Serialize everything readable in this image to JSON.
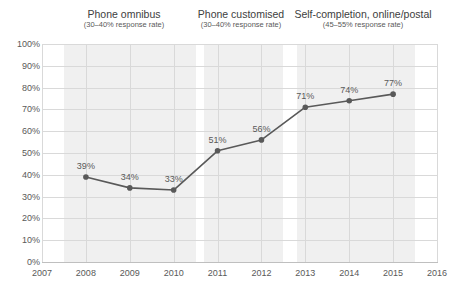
{
  "chart_data": {
    "type": "line",
    "title": "",
    "subtitle": "",
    "xlabel": "",
    "ylabel": "",
    "xlim": [
      2007,
      2016
    ],
    "ylim": [
      0,
      100
    ],
    "grid": true,
    "legend_position": "none",
    "x": [
      2008,
      2009,
      2010,
      2011,
      2012,
      2013,
      2014,
      2015
    ],
    "values": [
      39,
      34,
      33,
      51,
      56,
      71,
      74,
      77
    ],
    "point_labels": [
      "39%",
      "34%",
      "33%",
      "51%",
      "56%",
      "71%",
      "74%",
      "77%"
    ],
    "series": [
      {
        "name": "response rate",
        "x": [
          2008,
          2009,
          2010,
          2011,
          2012,
          2013,
          2014,
          2015
        ],
        "values": [
          39,
          34,
          33,
          51,
          56,
          71,
          74,
          77
        ]
      }
    ],
    "x_tick_labels": [
      "2007",
      "2008",
      "2009",
      "2010",
      "2011",
      "2012",
      "2013",
      "2014",
      "2015",
      "2016"
    ],
    "y_tick_labels": [
      "0%",
      "10%",
      "20%",
      "30%",
      "40%",
      "50%",
      "60%",
      "70%",
      "80%",
      "90%",
      "100%"
    ],
    "y_tick_values": [
      0,
      10,
      20,
      30,
      40,
      50,
      60,
      70,
      80,
      90,
      100
    ],
    "annotations": [
      {
        "title": "Phone omnibus",
        "subtitle": "(30–40% response rate)",
        "span_start": 2007.5,
        "span_end": 2010.5
      },
      {
        "title": "Phone customised",
        "subtitle": "(30–40% response rate)",
        "span_start": 2010.7,
        "span_end": 2012.5
      },
      {
        "title": "Self-completion, online/postal",
        "subtitle": "(45–55% response rate)",
        "span_start": 2012.8,
        "span_end": 2015.5
      }
    ],
    "colors": {
      "line": "#595959",
      "marker": "#595959",
      "band": "#ebebeb",
      "gridline": "#d9d9d9",
      "text": "#595959",
      "background": "#ffffff"
    }
  }
}
